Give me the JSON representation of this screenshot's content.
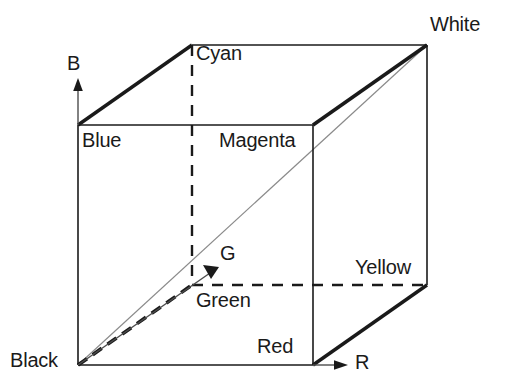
{
  "figure": {
    "background_color": "#ffffff",
    "stroke_color": "#1a1a1a",
    "diagonal_color": "#8a8a8a",
    "axis_color": "#4d4d4d"
  },
  "vertices": {
    "black": {
      "label": "Black",
      "x": 78,
      "y": 365
    },
    "blue": {
      "label": "Blue",
      "x": 78,
      "y": 125
    },
    "red": {
      "label": "Red",
      "x": 313,
      "y": 365
    },
    "magenta": {
      "label": "Magenta",
      "x": 313,
      "y": 125
    },
    "green": {
      "label": "Green",
      "x": 192,
      "y": 285
    },
    "cyan": {
      "label": "Cyan",
      "x": 192,
      "y": 45
    },
    "yellow": {
      "label": "Yellow",
      "x": 427,
      "y": 285
    },
    "white": {
      "label": "White",
      "x": 427,
      "y": 45
    }
  },
  "axes": {
    "b": {
      "label": "B",
      "direction": "up",
      "from": [
        78,
        365
      ],
      "to": [
        78,
        85
      ]
    },
    "r": {
      "label": "R",
      "direction": "right",
      "from": [
        78,
        365
      ],
      "to": [
        348,
        365
      ]
    },
    "g": {
      "label": "G",
      "direction": "diagonal-up-right",
      "from": [
        78,
        365
      ],
      "to": [
        218,
        268
      ]
    }
  },
  "edges": [
    {
      "name": "black-red",
      "from": "black",
      "to": "red",
      "style": "solid-thin"
    },
    {
      "name": "black-blue",
      "from": "black",
      "to": "blue",
      "style": "solid-thin"
    },
    {
      "name": "blue-magenta",
      "from": "blue",
      "to": "magenta",
      "style": "solid-thin"
    },
    {
      "name": "red-magenta",
      "from": "red",
      "to": "magenta",
      "style": "solid-thin"
    },
    {
      "name": "blue-cyan",
      "from": "blue",
      "to": "cyan",
      "style": "solid-thick"
    },
    {
      "name": "cyan-white",
      "from": "cyan",
      "to": "white",
      "style": "solid-thin"
    },
    {
      "name": "magenta-white",
      "from": "magenta",
      "to": "white",
      "style": "solid-thick"
    },
    {
      "name": "white-yellow",
      "from": "white",
      "to": "yellow",
      "style": "solid-thin"
    },
    {
      "name": "red-yellow",
      "from": "red",
      "to": "yellow",
      "style": "solid-thick"
    },
    {
      "name": "cyan-green",
      "from": "cyan",
      "to": "green",
      "style": "dashed"
    },
    {
      "name": "green-yellow",
      "from": "green",
      "to": "yellow",
      "style": "dashed"
    },
    {
      "name": "black-green",
      "from": "black",
      "to": "green",
      "style": "dashed-thick"
    },
    {
      "name": "black-white",
      "from": "black",
      "to": "white",
      "style": "solid-gray-diagonal"
    }
  ],
  "icons": {
    "b_arrowhead": "arrow-up-icon",
    "r_arrowhead": "arrow-right-icon",
    "g_arrowhead": "arrow-diagonal-icon"
  }
}
